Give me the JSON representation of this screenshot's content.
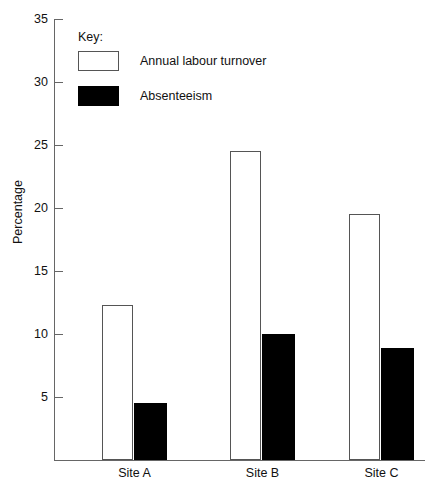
{
  "chart_data": {
    "type": "bar",
    "title": "",
    "xlabel": "",
    "ylabel": "Percentage",
    "categories": [
      "Site A",
      "Site B",
      "Site C"
    ],
    "series": [
      {
        "name": "Annual labour turnover",
        "values": [
          12.3,
          24.5,
          19.5
        ],
        "fill": "#ffffff",
        "stroke": "#555555"
      },
      {
        "name": "Absenteeism",
        "values": [
          4.5,
          10.0,
          8.9
        ],
        "fill": "#000000",
        "stroke": "#000000"
      }
    ],
    "ylim": [
      0,
      35
    ],
    "yticks": [
      5,
      10,
      15,
      20,
      25,
      30,
      35
    ],
    "ytick_labels": [
      "5",
      "10",
      "15",
      "20",
      "25",
      "30",
      "35"
    ],
    "grid": false,
    "legend_position": "top-left",
    "legend_title": "Key:"
  },
  "axis": {
    "y_title": "Percentage"
  },
  "legend": {
    "title": "Key:",
    "entries": [
      {
        "label": "Annual labour turnover",
        "style": "open"
      },
      {
        "label": "Absenteeism",
        "style": "solid"
      }
    ]
  }
}
